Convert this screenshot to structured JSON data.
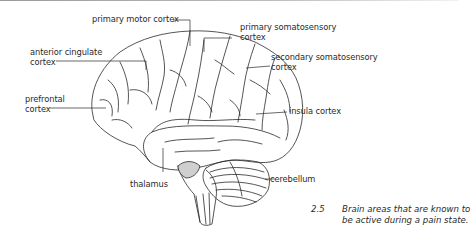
{
  "figure": {
    "number": "2.5",
    "caption_lines": [
      "Brain areas that are known to",
      "be active during a pain state."
    ]
  },
  "labels": {
    "primary_motor_cortex": "primary motor cortex",
    "primary_somatosensory_cortex": [
      "primary somatosensory",
      "cortex"
    ],
    "secondary_somatosensory_cortex": [
      "secondary somatosensory",
      "cortex"
    ],
    "anterior_cingulate_cortex": [
      "anterior cingulate",
      "cortex"
    ],
    "prefrontal_cortex": [
      "prefrontal",
      "cortex"
    ],
    "insula_cortex": "insula cortex",
    "thalamus": "thalamus",
    "cerebellum": "cerebellum"
  },
  "colors": {
    "line": "#2a2a2a",
    "background": "#ffffff",
    "shade": "#cfcfcf"
  }
}
